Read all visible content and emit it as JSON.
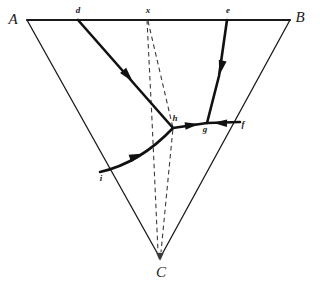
{
  "figure": {
    "type": "geometric-diagram",
    "background_color": "#ffffff",
    "line_color": "#1a1a1a",
    "width": 320,
    "height": 290
  },
  "vertices": [
    {
      "id": "A",
      "label": "A",
      "label_x": 13,
      "label_y": 21,
      "x": 27,
      "y": 20
    },
    {
      "id": "B",
      "label": "B",
      "label_x": 300,
      "label_y": 19,
      "x": 290,
      "y": 20
    },
    {
      "id": "C",
      "label": "C",
      "label_x": 161,
      "label_y": 274,
      "x": 160,
      "y": 258
    }
  ],
  "nodes": [
    {
      "id": "d",
      "label": "d",
      "label_x": 78,
      "label_y": 11,
      "x": 78,
      "y": 20
    },
    {
      "id": "x",
      "label": "x",
      "label_x": 148,
      "label_y": 11,
      "x": 147,
      "y": 20
    },
    {
      "id": "e",
      "label": "e",
      "label_x": 228,
      "label_y": 11,
      "x": 227,
      "y": 20
    },
    {
      "id": "f",
      "label": "f",
      "label_x": 243,
      "label_y": 125,
      "x": 240,
      "y": 122
    },
    {
      "id": "g",
      "label": "g",
      "label_x": 205,
      "label_y": 130,
      "x": 207,
      "y": 123
    },
    {
      "id": "h",
      "label": "h",
      "label_x": 175,
      "label_y": 119,
      "x": 173,
      "y": 128
    },
    {
      "id": "i",
      "label": "i",
      "label_x": 101,
      "label_y": 179,
      "x": 100,
      "y": 172
    }
  ],
  "edges": {
    "triangle_top": {
      "name": "AB",
      "from": "A",
      "to": "B",
      "style": "solid-heavy",
      "d": "M 27 20 L 290 20"
    },
    "triangle_left": {
      "name": "AC",
      "from": "A",
      "to": "C",
      "style": "solid",
      "d": "M 27 20 L 160 258"
    },
    "triangle_right": {
      "name": "BC",
      "from": "B",
      "to": "C",
      "style": "solid",
      "d": "M 290 20 L 160 258"
    }
  },
  "flows": [
    {
      "name": "d-to-h",
      "from": "d",
      "to": "h",
      "style": "solid-thick",
      "d": "M 78 20 L 173 128",
      "arrows": [
        {
          "x": 128,
          "y": 76,
          "angle": 49
        }
      ]
    },
    {
      "name": "i-to-h",
      "from": "i",
      "to": "h",
      "style": "solid-thick-curved",
      "d": "M 100 172 Q 140 163 173 128",
      "arrows": [
        {
          "x": 137,
          "y": 156,
          "angle": -19
        }
      ]
    },
    {
      "name": "h-to-g",
      "from": "h",
      "to": "g",
      "style": "solid-thick",
      "d": "M 173 128 L 207 123",
      "arrows": [
        {
          "x": 192,
          "y": 125,
          "angle": -8
        }
      ]
    },
    {
      "name": "f-to-g",
      "from": "f",
      "to": "g",
      "style": "solid-thick",
      "d": "M 240 122 L 207 123",
      "arrows": [
        {
          "x": 220,
          "y": 123,
          "angle": 182
        }
      ]
    },
    {
      "name": "e-to-g",
      "from": "e",
      "to": "g",
      "style": "solid-thick",
      "d": "M 227 20 L 219 76 L 207 123",
      "arrows": [
        {
          "x": 221,
          "y": 68,
          "angle": 103
        }
      ]
    }
  ],
  "dashed_paths": [
    {
      "name": "x-to-C-direct",
      "from": "x",
      "to": "C",
      "d": "M 147 20 L 152 120 L 158 252",
      "arrow": {
        "x": 159,
        "y": 253,
        "angle": 87
      }
    },
    {
      "name": "x-to-h-to-C",
      "from": "x",
      "to": "C",
      "via": "h",
      "d": "M 148 21 L 173 128 L 161 252",
      "arrow": {
        "x": 161,
        "y": 253,
        "angle": 95
      }
    }
  ],
  "caption": ""
}
